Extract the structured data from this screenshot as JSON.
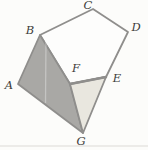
{
  "figure": {
    "background_color": "#fcfcfa",
    "edge_color": "#8f8e8c",
    "label_color": "#3d3c3a",
    "label_font_size": 11.5,
    "vertices": {
      "A": {
        "x": 18,
        "y": 84,
        "label": "A",
        "label_x": 9,
        "label_y": 85
      },
      "B": {
        "x": 40,
        "y": 35,
        "label": "B",
        "label_x": 30,
        "label_y": 30
      },
      "C": {
        "x": 93,
        "y": 9,
        "label": "C",
        "label_x": 88,
        "label_y": 5
      },
      "D": {
        "x": 128,
        "y": 32,
        "label": "D",
        "label_x": 136,
        "label_y": 27
      },
      "E": {
        "x": 106,
        "y": 77,
        "label": "E",
        "label_x": 117,
        "label_y": 78
      },
      "F": {
        "x": 70,
        "y": 84,
        "label": "F",
        "label_x": 76,
        "label_y": 68
      },
      "G": {
        "x": 83,
        "y": 133,
        "label": "G",
        "label_x": 81,
        "label_y": 141
      }
    },
    "regions": [
      {
        "name": "pentagon-BCDEF",
        "points": [
          "B",
          "C",
          "D",
          "E",
          "F"
        ],
        "fill": "#fdfdfc",
        "stroke_width": 1.8
      },
      {
        "name": "quad-ABFG-shaded",
        "points": [
          "A",
          "B",
          "F",
          "G"
        ],
        "fill": "#a9a8a5",
        "stroke_width": 1.8
      },
      {
        "name": "triangle-FEG-light",
        "points": [
          "F",
          "E",
          "G"
        ],
        "fill": "#e9e7df",
        "stroke_width": 1.8
      }
    ],
    "emphasized_edges": [
      {
        "name": "edge-FE",
        "from": "F",
        "to": "E",
        "stroke_width": 2.4
      }
    ],
    "artifacts": {
      "fold_line": {
        "x1": 46,
        "y1": 38,
        "x2": 45.5,
        "y2": 103,
        "color": "rgba(255,255,255,0.32)",
        "width": 1.3
      },
      "scan_line": {
        "x1": 0,
        "y1": 146,
        "x2": 148,
        "y2": 146,
        "color": "#e7e6e2",
        "width": 1.6
      }
    }
  }
}
